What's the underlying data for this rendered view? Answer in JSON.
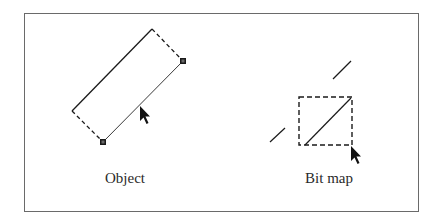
{
  "figure": {
    "panels": [
      {
        "id": "object",
        "caption": "Object",
        "description": "Rotated rectangle selection with two square handles and a pointer on the edge",
        "icons": [
          "selection-handle",
          "selection-handle",
          "arrow-cursor"
        ]
      },
      {
        "id": "bitmap",
        "caption": "Bit map",
        "description": "Dashed square marquee containing a diagonal line segment, with stray line fragments and a pointer at corner",
        "icons": [
          "arrow-cursor"
        ]
      }
    ],
    "colors": {
      "stroke": "#1a1a1a",
      "frame": "#6a6a6a",
      "background": "#ffffff"
    }
  }
}
